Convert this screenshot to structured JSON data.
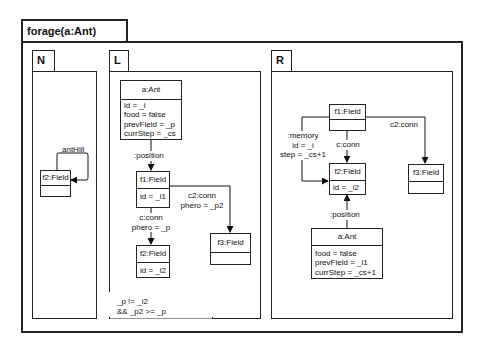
{
  "rule": {
    "title": "forage(a:Ant)"
  },
  "panels": {
    "nac": {
      "label": "N",
      "objects": [
        {
          "id": "n_f2",
          "header": "f2:Field",
          "attributes": []
        }
      ],
      "links": [
        {
          "label": "antHill",
          "from": "f2:Field",
          "to": "f2:Field"
        }
      ]
    },
    "lhs": {
      "label": "L",
      "objects": [
        {
          "id": "l_ant",
          "header": "a:Ant",
          "attributes": [
            "id = _i",
            "food = false",
            "prevField = _p",
            "currStep = _cs"
          ]
        },
        {
          "id": "l_f1",
          "header": "f1:Field",
          "attributes": [
            "id = _i1"
          ]
        },
        {
          "id": "l_f2",
          "header": "f2:Field",
          "attributes": [
            "id = _i2"
          ]
        },
        {
          "id": "l_f3",
          "header": "f3:Field",
          "attributes": []
        }
      ],
      "links": [
        {
          "label": ":position",
          "from": "a:Ant",
          "to": "f1:Field"
        },
        {
          "label": "c:conn\nphero = _p",
          "label_lines": [
            "c:conn",
            "phero = _p"
          ],
          "from": "f1:Field",
          "to": "f2:Field"
        },
        {
          "label": "c2:conn\nphero = _p2",
          "label_lines": [
            "c2:conn",
            "phero = _p2"
          ],
          "from": "f1:Field",
          "to": "f3:Field"
        }
      ],
      "condition": {
        "lines": [
          "_p != _i2",
          "&& _p2 >= _p"
        ]
      }
    },
    "rhs": {
      "label": "R",
      "objects": [
        {
          "id": "r_f1",
          "header": "f1:Field",
          "attributes": []
        },
        {
          "id": "r_f2",
          "header": "f2:Field",
          "attributes": [
            "id = _i2"
          ]
        },
        {
          "id": "r_f3",
          "header": "f3:Field",
          "attributes": []
        },
        {
          "id": "r_ant",
          "header": "a:Ant",
          "attributes": [
            "food = false",
            "prevField = _i1",
            "currStep = _cs+1"
          ]
        }
      ],
      "links": [
        {
          "label_lines": [
            ":memory",
            "id = _i",
            "step = _cs+1"
          ],
          "from": "f1:Field",
          "to": "f2:Field"
        },
        {
          "label_lines": [
            "c:conn"
          ],
          "from": "f1:Field",
          "to": "f2:Field"
        },
        {
          "label_lines": [
            "c2:conn"
          ],
          "from": "f1:Field",
          "to": "f3:Field"
        },
        {
          "label_lines": [
            ":position"
          ],
          "from": "a:Ant",
          "to": "f2:Field"
        }
      ]
    }
  }
}
